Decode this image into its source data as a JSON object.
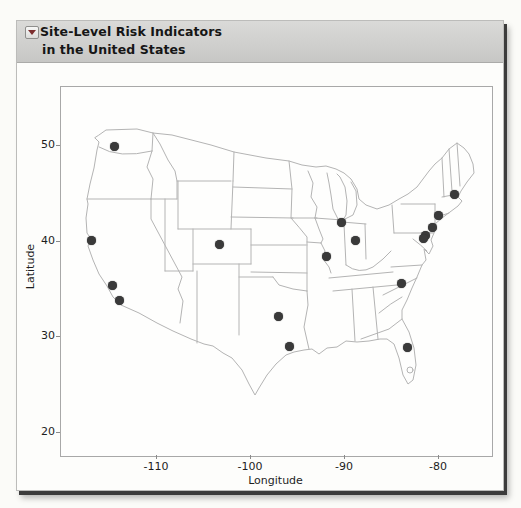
{
  "header": {
    "disclosure_icon": "triangle-down",
    "title_line1": "Site-Level Risk Indicators",
    "title_line2": "in the United States"
  },
  "chart_data": {
    "type": "scatter",
    "title": "Site-Level Risk Indicators in the United States",
    "xlabel": "Longitude",
    "ylabel": "Latitude",
    "x_ticks": [
      -110,
      -100,
      -90,
      -80
    ],
    "y_ticks": [
      50,
      40,
      30,
      20
    ],
    "xlim": [
      -120.2,
      -74.3
    ],
    "ylim": [
      17.6,
      56.2
    ],
    "grid": false,
    "legend": "none",
    "background": "us-states-map-outline",
    "marker": {
      "shape": "circle",
      "color": "#3a3a3a",
      "diameter_px": 9
    },
    "points": [
      {
        "lon": -114.5,
        "lat": 49.9
      },
      {
        "lon": -117.0,
        "lat": 40.1
      },
      {
        "lon": -114.7,
        "lat": 35.4
      },
      {
        "lon": -114.0,
        "lat": 33.9
      },
      {
        "lon": -103.4,
        "lat": 39.7
      },
      {
        "lon": -97.1,
        "lat": 32.2
      },
      {
        "lon": -95.9,
        "lat": 29.1
      },
      {
        "lon": -92.0,
        "lat": 38.5
      },
      {
        "lon": -90.4,
        "lat": 42.0
      },
      {
        "lon": -88.9,
        "lat": 40.1
      },
      {
        "lon": -84.0,
        "lat": 35.6
      },
      {
        "lon": -83.4,
        "lat": 28.9
      },
      {
        "lon": -78.3,
        "lat": 44.9
      },
      {
        "lon": -80.1,
        "lat": 42.7
      },
      {
        "lon": -80.7,
        "lat": 41.5
      },
      {
        "lon": -81.4,
        "lat": 40.6
      },
      {
        "lon": -81.7,
        "lat": 40.3
      }
    ]
  },
  "colors": {
    "page_bg": "#fbfbf8",
    "window_bg": "#fdfdfb",
    "header_bg_top": "#dadad8",
    "header_bg_bottom": "#c7c7c5",
    "header_text": "#161616",
    "plot_border": "#a8a8a8",
    "map_line": "#b4b4b4",
    "axis_text": "#1e1e1e",
    "marker": "#3a3a3a",
    "disclosure_triangle": "#7c2e2e",
    "window_edge_shadow": "#3c3c3c"
  }
}
